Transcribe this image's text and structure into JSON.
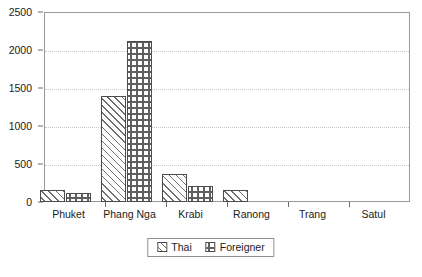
{
  "chart_data": {
    "type": "bar",
    "title": "",
    "subtitle": "",
    "xlabel": "",
    "ylabel": "",
    "categories": [
      "Phuket",
      "Phang Nga",
      "Krabi",
      "Ranong",
      "Trang",
      "Satul"
    ],
    "series": [
      {
        "name": "Thai",
        "values": [
          155,
          1390,
          365,
          155,
          0,
          0
        ]
      },
      {
        "name": "Foreigner",
        "values": [
          115,
          2115,
          205,
          0,
          0,
          0
        ]
      }
    ],
    "ylim": [
      0,
      2500
    ],
    "yticks": [
      0,
      500,
      1000,
      1500,
      2000,
      2500
    ],
    "ytick_labels": [
      "0",
      "500",
      "1000",
      "1500",
      "2000",
      "2500"
    ],
    "grid": "horizontal-dotted",
    "legend_position": "bottom-center",
    "legend": [
      "Thai",
      "Foreigner"
    ]
  },
  "axes": {
    "y": {
      "ticks": [
        {
          "value": 2500,
          "label": "2500"
        },
        {
          "value": 2000,
          "label": "2000"
        },
        {
          "value": 1500,
          "label": "1500"
        },
        {
          "value": 1000,
          "label": "1000"
        },
        {
          "value": 500,
          "label": "500"
        },
        {
          "value": 0,
          "label": "0"
        }
      ]
    },
    "x": {
      "ticks": [
        {
          "label": "Phuket"
        },
        {
          "label": "Phang Nga"
        },
        {
          "label": "Krabi"
        },
        {
          "label": "Ranong"
        },
        {
          "label": "Trang"
        },
        {
          "label": "Satul"
        }
      ]
    }
  },
  "legend": {
    "items": [
      {
        "label": "Thai",
        "pattern": "diagonal-hatch"
      },
      {
        "label": "Foreigner",
        "pattern": "dotted-grid"
      }
    ]
  },
  "colors": {
    "frame": "#9a9a9a",
    "gridline": "#c9c9c9",
    "bar_outline": "#4c4c4c",
    "pattern": "#6e6e6e",
    "text": "#1a1a1a",
    "background": "#ffffff"
  }
}
